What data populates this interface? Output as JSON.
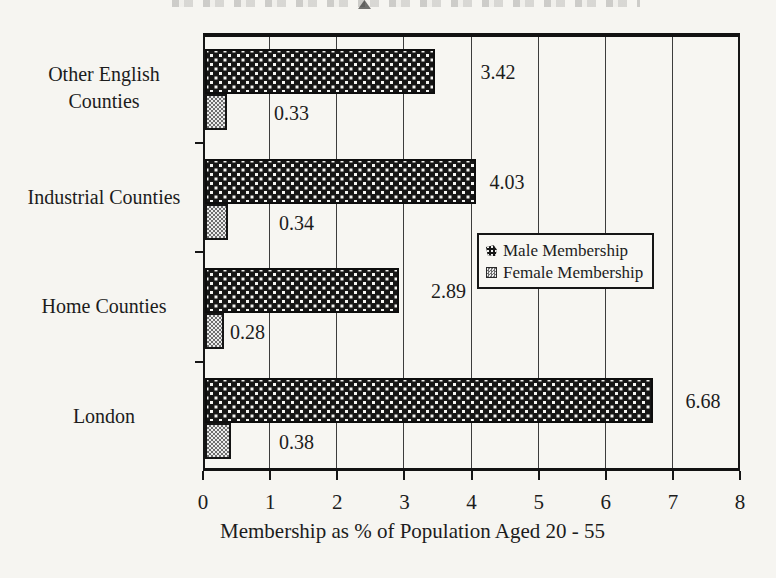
{
  "chart_data": {
    "type": "bar",
    "orientation": "horizontal",
    "categories": [
      "Other English Counties",
      "Industrial Counties",
      "Home Counties",
      "London"
    ],
    "series": [
      {
        "name": "Male Membership",
        "pattern": "black-white-speckle",
        "values": [
          3.42,
          4.03,
          2.89,
          6.68
        ],
        "value_labels": [
          "3.42",
          "4.03",
          "2.89",
          "6.68"
        ]
      },
      {
        "name": "Female Membership",
        "pattern": "gray-checker-dither",
        "values": [
          0.33,
          0.34,
          0.28,
          0.38
        ],
        "value_labels": [
          "0.33",
          "0.34",
          "0.28",
          "0.38"
        ]
      }
    ],
    "xlabel": "Membership as % of Population Aged 20 - 55",
    "xlim": [
      0,
      8
    ],
    "xticks": [
      "0",
      "1",
      "2",
      "3",
      "4",
      "5",
      "6",
      "7",
      "8"
    ],
    "grid": "vertical-gridlines-on",
    "legend": {
      "position": "center-right-inside-plot",
      "entries": [
        "Male Membership",
        "Female Membership"
      ]
    }
  },
  "colors": {
    "ink": "#1c1c1c",
    "paper": "#f6f5f1",
    "male_fill": "#161616",
    "male_dots": "#f4f4f2",
    "female_dark": "#6e6e6e",
    "female_light": "#ececec"
  }
}
